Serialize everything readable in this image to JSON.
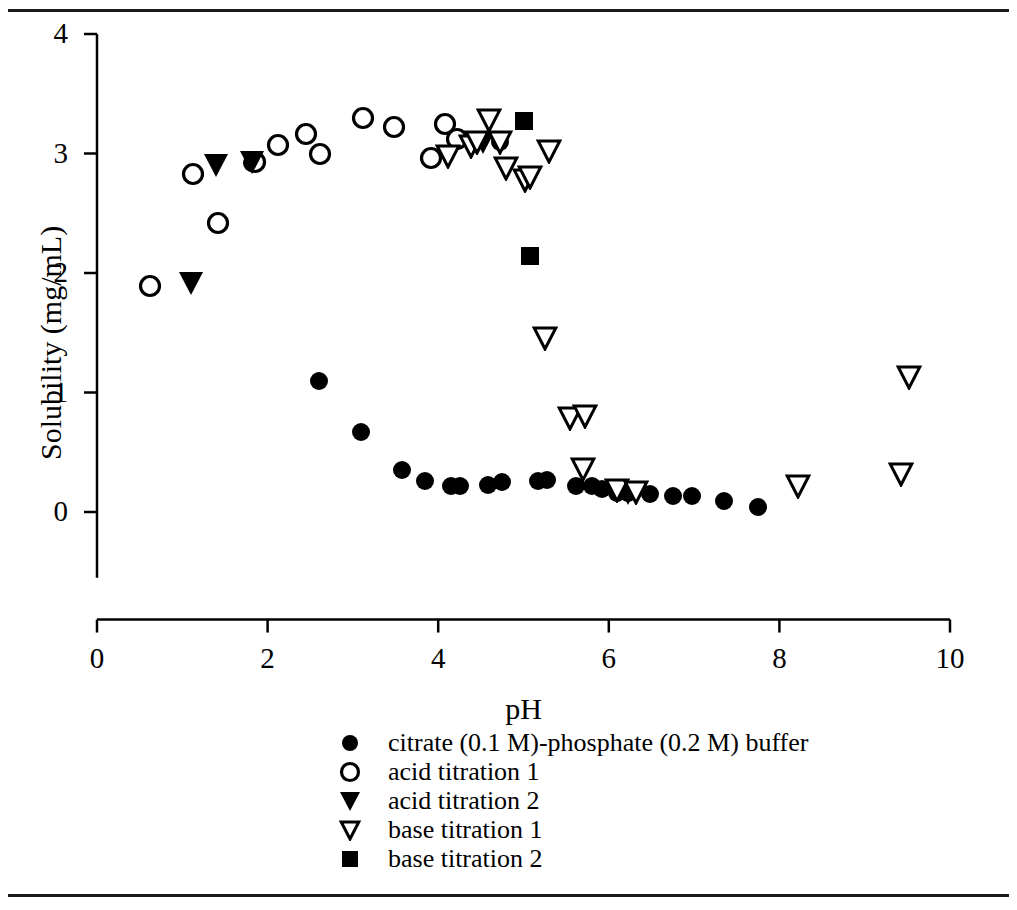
{
  "figure": {
    "top_rule": true,
    "bottom_rule": true,
    "background": "#ffffff",
    "ink_color": "#000000"
  },
  "chart_data": {
    "type": "scatter",
    "title": "",
    "xlabel": "pH",
    "ylabel": "Solubility (mg/mL)",
    "xlim": [
      0,
      10
    ],
    "ylim": [
      0,
      4
    ],
    "xticks": [
      0,
      2,
      4,
      6,
      8,
      10
    ],
    "yticks": [
      0,
      1,
      2,
      3,
      4
    ],
    "grid": false,
    "legend_position": "bottom-center",
    "series": [
      {
        "name": "citrate (0.1 M)-phosphate (0.2 M) buffer",
        "marker": "filled-circle",
        "color": "#000000",
        "points": [
          [
            1.82,
            2.92
          ],
          [
            2.6,
            1.1
          ],
          [
            3.1,
            0.67
          ],
          [
            3.58,
            0.35
          ],
          [
            3.85,
            0.26
          ],
          [
            4.15,
            0.22
          ],
          [
            4.25,
            0.22
          ],
          [
            4.58,
            0.23
          ],
          [
            4.75,
            0.25
          ],
          [
            4.72,
            3.1
          ],
          [
            5.17,
            0.26
          ],
          [
            5.28,
            0.27
          ],
          [
            5.62,
            0.22
          ],
          [
            5.8,
            0.22
          ],
          [
            5.92,
            0.19
          ],
          [
            6.1,
            0.16
          ],
          [
            6.22,
            0.16
          ],
          [
            6.48,
            0.15
          ],
          [
            6.75,
            0.13
          ],
          [
            6.98,
            0.13
          ],
          [
            7.35,
            0.09
          ],
          [
            7.75,
            0.04
          ]
        ]
      },
      {
        "name": "acid titration 1",
        "marker": "open-circle",
        "color": "#000000",
        "points": [
          [
            0.62,
            1.89
          ],
          [
            1.12,
            2.83
          ],
          [
            1.42,
            2.42
          ],
          [
            1.85,
            2.93
          ],
          [
            2.12,
            3.07
          ],
          [
            2.45,
            3.16
          ],
          [
            2.62,
            3.0
          ],
          [
            3.12,
            3.3
          ],
          [
            3.48,
            3.22
          ],
          [
            3.92,
            2.96
          ],
          [
            4.08,
            3.25
          ],
          [
            4.22,
            3.12
          ]
        ]
      },
      {
        "name": "acid titration 2",
        "marker": "filled-triangle-down",
        "color": "#000000",
        "points": [
          [
            1.1,
            1.92
          ],
          [
            1.4,
            2.9
          ],
          [
            1.82,
            2.93
          ],
          [
            4.52,
            3.1
          ],
          [
            6.22,
            0.16
          ]
        ]
      },
      {
        "name": "base titration 1",
        "marker": "open-triangle-down",
        "color": "#000000",
        "points": [
          [
            4.12,
            2.98
          ],
          [
            4.38,
            3.06
          ],
          [
            4.45,
            3.1
          ],
          [
            4.6,
            3.28
          ],
          [
            4.72,
            3.1
          ],
          [
            4.8,
            2.88
          ],
          [
            5.02,
            2.78
          ],
          [
            5.08,
            2.8
          ],
          [
            5.3,
            3.02
          ],
          [
            5.25,
            1.46
          ],
          [
            5.55,
            0.79
          ],
          [
            5.72,
            0.8
          ],
          [
            5.7,
            0.36
          ],
          [
            6.1,
            0.18
          ],
          [
            6.32,
            0.17
          ],
          [
            8.22,
            0.22
          ],
          [
            9.42,
            0.32
          ],
          [
            9.52,
            1.13
          ]
        ]
      },
      {
        "name": "base titration 2",
        "marker": "filled-square",
        "color": "#000000",
        "points": [
          [
            5.0,
            3.27
          ],
          [
            5.08,
            2.14
          ]
        ]
      }
    ]
  },
  "legend": {
    "entries": [
      {
        "label": "citrate (0.1 M)-phosphate (0.2 M) buffer",
        "marker": "filled-circle"
      },
      {
        "label": "acid titration 1",
        "marker": "open-circle"
      },
      {
        "label": "acid titration 2",
        "marker": "filled-triangle-down"
      },
      {
        "label": "base titration 1",
        "marker": "open-triangle-down"
      },
      {
        "label": "base titration 2",
        "marker": "filled-square"
      }
    ]
  }
}
